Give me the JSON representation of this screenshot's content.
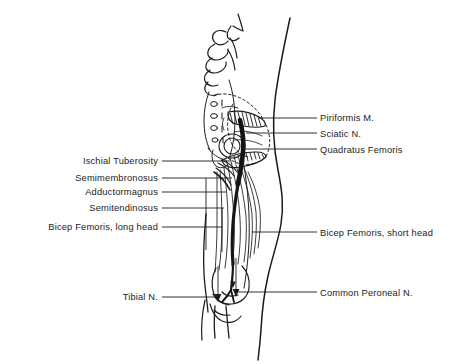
{
  "figure": {
    "background_color": "#ffffff",
    "ink_color": "#1b1b1b",
    "width": 462,
    "height": 364
  },
  "labels": {
    "piriformis": "Piriformis M.",
    "sciatic": "Sciatic N.",
    "quadratus": "Quadratus Femoris",
    "ischial": "Ischial Tuberosity",
    "semimembronosus": "Semimembronosus",
    "adductormagnus": "Adductormagnus",
    "semitendinosus": "Semitendinosus",
    "bicep_long": "Bicep Femoris, long head",
    "bicep_short": "Bicep Femoris, short head",
    "tibial": "Tibial N.",
    "common_peroneal": "Common Peroneal N."
  },
  "label_layout": [
    {
      "key": "piriformis",
      "side": "right",
      "text_x": 320,
      "text_y": 113,
      "leader_from": 259,
      "leader_to": 317,
      "leader_y": 118
    },
    {
      "key": "sciatic",
      "side": "right",
      "text_x": 320,
      "text_y": 129,
      "leader_from": 246,
      "leader_to": 317,
      "leader_y": 133
    },
    {
      "key": "quadratus",
      "side": "right",
      "text_x": 320,
      "text_y": 145,
      "leader_from": 242,
      "leader_to": 317,
      "leader_y": 149
    },
    {
      "key": "bicep_short",
      "side": "right",
      "text_x": 320,
      "text_y": 228,
      "leader_from": 252,
      "leader_to": 317,
      "leader_y": 232
    },
    {
      "key": "common_peroneal",
      "side": "right",
      "text_x": 320,
      "text_y": 288,
      "leader_from": 232,
      "leader_to": 317,
      "leader_y": 292
    },
    {
      "key": "ischial",
      "side": "left",
      "text_x": 158,
      "text_y": 156,
      "leader_from": 162,
      "leader_to": 230,
      "leader_y": 161
    },
    {
      "key": "semimembronosus",
      "side": "left",
      "text_x": 158,
      "text_y": 173,
      "leader_from": 162,
      "leader_to": 232,
      "leader_y": 178
    },
    {
      "key": "adductormagnus",
      "side": "left",
      "text_x": 158,
      "text_y": 187,
      "leader_from": 162,
      "leader_to": 226,
      "leader_y": 192
    },
    {
      "key": "semitendinosus",
      "side": "left",
      "text_x": 158,
      "text_y": 203,
      "leader_from": 162,
      "leader_to": 224,
      "leader_y": 208
    },
    {
      "key": "bicep_long",
      "side": "left",
      "text_x": 158,
      "text_y": 222,
      "leader_from": 162,
      "leader_to": 222,
      "leader_y": 227
    },
    {
      "key": "tibial",
      "side": "left",
      "text_x": 158,
      "text_y": 292,
      "leader_from": 162,
      "leader_to": 218,
      "leader_y": 297
    }
  ],
  "anatomy": {
    "structures": [
      "vertebral-spinous-processes",
      "sacrum",
      "ilium",
      "greater-trochanter",
      "piriformis-muscle",
      "quadratus-femoris-muscle",
      "sciatic-nerve",
      "hamstring-muscle-fibers",
      "femur-shaft",
      "popliteal-fossa",
      "tibial-nerve-branch",
      "common-peroneal-nerve-branch",
      "body-outline-posterior",
      "leg-outline"
    ]
  }
}
